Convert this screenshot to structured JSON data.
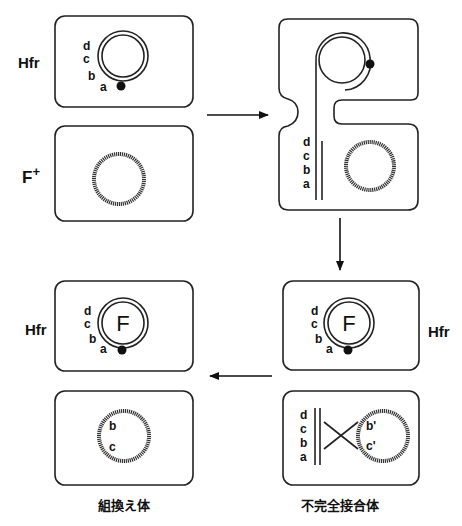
{
  "diagram": {
    "type": "Hfr conjugation / recombination schematic",
    "labels": {
      "hfr_top": "Hfr",
      "fplus": "F",
      "fplus_sup": "+",
      "hfr_bottom_left": "Hfr",
      "hfr_bottom_right": "Hfr",
      "recombinant_caption": "組換え体",
      "partial_zygote_caption": "不完全接合体"
    },
    "plasmid_label": "F",
    "genes": {
      "d": "d",
      "c": "c",
      "b": "b",
      "a": "a",
      "b_prime": "b'",
      "c_prime": "c'"
    },
    "panels": [
      {
        "id": "hfr-cell-top",
        "label": "Hfr",
        "genes": [
          "d",
          "c",
          "b",
          "a"
        ],
        "content": "double-stranded circular chromosome with origin dot"
      },
      {
        "id": "fplus-cell",
        "label": "F+",
        "content": "recipient chromosome"
      },
      {
        "id": "conjugating-pair",
        "content": "Hfr transfers linear strand d-c-b-a into recipient"
      },
      {
        "id": "hfr-cell-after-right",
        "label": "Hfr",
        "plasmid": "F",
        "genes": [
          "d",
          "c",
          "b",
          "a"
        ]
      },
      {
        "id": "partial-zygote",
        "caption": "不完全接合体",
        "genes": [
          "d",
          "c",
          "b",
          "a",
          "b'",
          "c'"
        ],
        "content": "crossover between fragment and recipient chromosome"
      },
      {
        "id": "hfr-cell-after-left",
        "label": "Hfr",
        "plasmid": "F",
        "genes": [
          "d",
          "c",
          "b",
          "a"
        ]
      },
      {
        "id": "recombinant",
        "caption": "組換え体",
        "genes": [
          "b",
          "c"
        ]
      }
    ],
    "arrows": [
      {
        "from": "hfr-cell-top",
        "to": "conjugating-pair",
        "direction": "right"
      },
      {
        "from": "conjugating-pair",
        "to": "hfr-cell-after-right",
        "direction": "down"
      },
      {
        "from": "partial-zygote",
        "to": "recombinant",
        "direction": "left"
      }
    ]
  }
}
